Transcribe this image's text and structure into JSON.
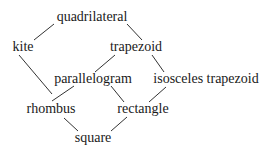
{
  "diagram": {
    "type": "hasse-diagram",
    "nodes": {
      "quadrilateral": {
        "label": "quadrilateral",
        "x": 92,
        "y": 17
      },
      "kite": {
        "label": "kite",
        "x": 23,
        "y": 47
      },
      "trapezoid": {
        "label": "trapezoid",
        "x": 136,
        "y": 47
      },
      "parallelogram": {
        "label": "parallelogram",
        "x": 93,
        "y": 79
      },
      "isosceles_trapezoid": {
        "label": "isosceles trapezoid",
        "x": 206,
        "y": 79
      },
      "rhombus": {
        "label": "rhombus",
        "x": 51,
        "y": 109
      },
      "rectangle": {
        "label": "rectangle",
        "x": 143,
        "y": 109
      },
      "square": {
        "label": "square",
        "x": 93,
        "y": 138
      }
    },
    "edges": [
      {
        "from": "quadrilateral",
        "to": "kite",
        "x1": 54,
        "y1": 24,
        "x2": 34,
        "y2": 40
      },
      {
        "from": "quadrilateral",
        "to": "trapezoid",
        "x1": 127,
        "y1": 24,
        "x2": 142,
        "y2": 40
      },
      {
        "from": "kite",
        "to": "rhombus",
        "x1": 19,
        "y1": 55,
        "x2": 52,
        "y2": 94
      },
      {
        "from": "trapezoid",
        "to": "parallelogram",
        "x1": 115,
        "y1": 55,
        "x2": 95,
        "y2": 72
      },
      {
        "from": "trapezoid",
        "to": "isosceles_trapezoid",
        "x1": 152,
        "y1": 55,
        "x2": 164,
        "y2": 72
      },
      {
        "from": "parallelogram",
        "to": "rhombus",
        "x1": 74,
        "y1": 86,
        "x2": 52,
        "y2": 101
      },
      {
        "from": "parallelogram",
        "to": "rectangle",
        "x1": 111,
        "y1": 86,
        "x2": 124,
        "y2": 102
      },
      {
        "from": "isosceles_trapezoid",
        "to": "rectangle",
        "x1": 166,
        "y1": 87,
        "x2": 149,
        "y2": 102
      },
      {
        "from": "rhombus",
        "to": "square",
        "x1": 64,
        "y1": 118,
        "x2": 78,
        "y2": 131
      },
      {
        "from": "rectangle",
        "to": "square",
        "x1": 127,
        "y1": 117,
        "x2": 111,
        "y2": 131
      }
    ],
    "colors": {
      "line": "#333333",
      "text": "#1a1a1a",
      "background": "#ffffff"
    }
  }
}
